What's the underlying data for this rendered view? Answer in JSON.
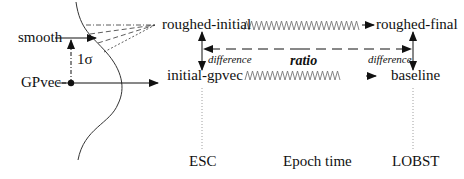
{
  "diagram": {
    "nodes": {
      "smooth": "smooth",
      "gpvec": "GPvec",
      "sigma": "1σ",
      "roughed_initial": "roughed-initial",
      "roughed_final": "roughed-final",
      "initial_gpvec": "initial-gpvec",
      "baseline": "baseline"
    },
    "relations": {
      "difference_left": "difference",
      "difference_right": "difference",
      "ratio": "ratio"
    },
    "time_axis": {
      "start": "ESC",
      "middle": "Epoch time",
      "end": "LOBST"
    },
    "colors": {
      "line": "#111111",
      "wave": "#777777",
      "dotted": "#888888"
    }
  }
}
